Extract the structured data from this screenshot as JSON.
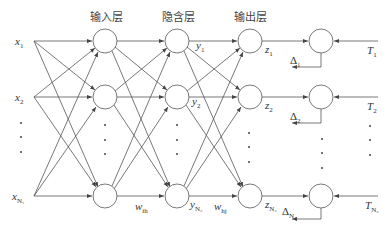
{
  "layers": {
    "input": "输入层",
    "hidden": "隐含层",
    "output": "输出层"
  },
  "inputs": [
    {
      "var": "x",
      "sub": "1"
    },
    {
      "var": "x",
      "sub": "2"
    },
    {
      "var": "x",
      "sub": "N₁"
    }
  ],
  "hidden_outputs": [
    {
      "var": "y",
      "sub": "1"
    },
    {
      "var": "y",
      "sub": "2"
    },
    {
      "var": "y",
      "sub": "N₂"
    }
  ],
  "outputs": [
    {
      "var": "z",
      "sub": "1"
    },
    {
      "var": "z",
      "sub": "2"
    },
    {
      "var": "z",
      "sub": "N₃"
    }
  ],
  "errors": [
    {
      "var": "Δ",
      "sub": "1"
    },
    {
      "var": "Δ",
      "sub": "2"
    },
    {
      "var": "Δ",
      "sub": "N₃"
    }
  ],
  "targets": [
    {
      "var": "T",
      "sub": "1"
    },
    {
      "var": "T",
      "sub": "2"
    },
    {
      "var": "T",
      "sub": "N₃"
    }
  ],
  "weights": {
    "input_hidden": {
      "var": "w",
      "sub": "ih"
    },
    "hidden_output": {
      "var": "w",
      "sub": "hj"
    }
  },
  "line_color": "#555555"
}
